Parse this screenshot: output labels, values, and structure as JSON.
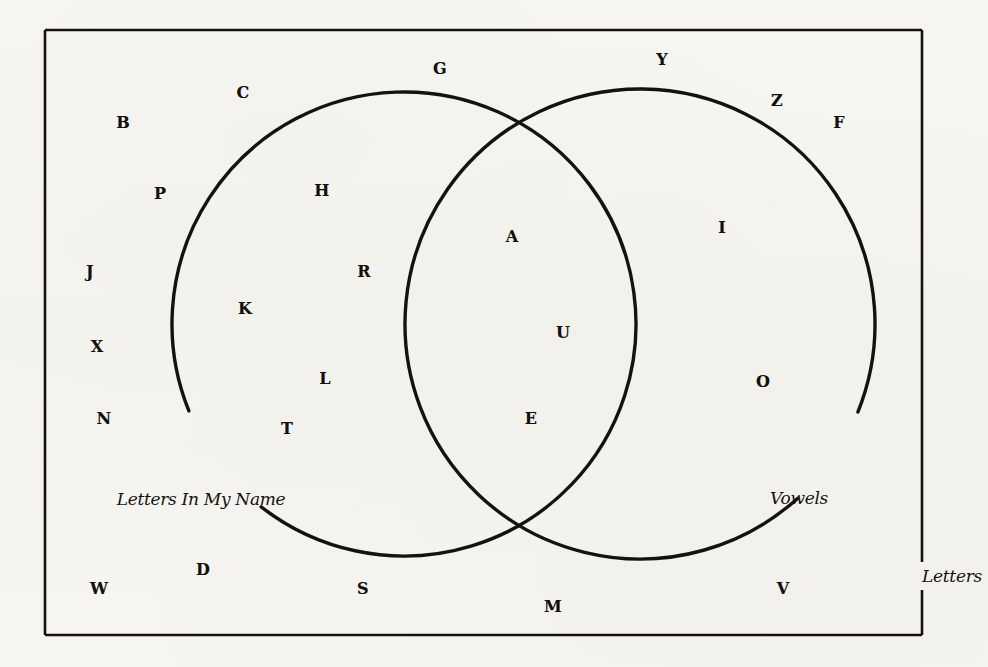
{
  "diagram": {
    "type": "venn",
    "title": "",
    "universe": {
      "label": "Letters",
      "label_x": 952,
      "label_y": 576,
      "rect": {
        "x": 45,
        "y": 30,
        "width": 877,
        "height": 605
      }
    },
    "sets": [
      {
        "id": "letters-in-my-name",
        "label": "Letters In My Name",
        "label_x": 201,
        "label_y": 499,
        "center_x": 404,
        "center_y": 324,
        "radius": 232
      },
      {
        "id": "vowels",
        "label": "Vowels",
        "label_x": 799,
        "label_y": 498,
        "center_x": 640,
        "center_y": 324,
        "radius": 235
      }
    ],
    "colors": {
      "stroke": "#141210",
      "background": "#f7f5f1",
      "text": "#13110f"
    },
    "regions": {
      "only_left": [
        "H",
        "R",
        "K",
        "L",
        "T"
      ],
      "intersection": [
        "A",
        "U",
        "E"
      ],
      "only_right": [
        "I",
        "O"
      ],
      "outside_both": [
        "B",
        "C",
        "G",
        "Y",
        "Z",
        "F",
        "P",
        "J",
        "X",
        "N",
        "W",
        "D",
        "S",
        "M",
        "V"
      ]
    },
    "elements": [
      {
        "label": "B",
        "x": 123,
        "y": 123,
        "region": "outside_both"
      },
      {
        "label": "C",
        "x": 243,
        "y": 93,
        "region": "outside_both"
      },
      {
        "label": "G",
        "x": 440,
        "y": 69,
        "region": "outside_both"
      },
      {
        "label": "Y",
        "x": 662,
        "y": 60,
        "region": "outside_both"
      },
      {
        "label": "Z",
        "x": 777,
        "y": 101,
        "region": "outside_both"
      },
      {
        "label": "F",
        "x": 839,
        "y": 123,
        "region": "outside_both"
      },
      {
        "label": "P",
        "x": 160,
        "y": 194,
        "region": "outside_both"
      },
      {
        "label": "J",
        "x": 90,
        "y": 272,
        "region": "outside_both"
      },
      {
        "label": "X",
        "x": 97,
        "y": 347,
        "region": "outside_both"
      },
      {
        "label": "N",
        "x": 104,
        "y": 419,
        "region": "outside_both"
      },
      {
        "label": "W",
        "x": 99,
        "y": 589,
        "region": "outside_both"
      },
      {
        "label": "D",
        "x": 203,
        "y": 570,
        "region": "outside_both"
      },
      {
        "label": "S",
        "x": 363,
        "y": 589,
        "region": "outside_both"
      },
      {
        "label": "M",
        "x": 553,
        "y": 607,
        "region": "outside_both"
      },
      {
        "label": "V",
        "x": 783,
        "y": 589,
        "region": "outside_both"
      },
      {
        "label": "H",
        "x": 322,
        "y": 191,
        "region": "only_left"
      },
      {
        "label": "R",
        "x": 364,
        "y": 272,
        "region": "only_left"
      },
      {
        "label": "K",
        "x": 245,
        "y": 309,
        "region": "only_left"
      },
      {
        "label": "L",
        "x": 325,
        "y": 379,
        "region": "only_left"
      },
      {
        "label": "T",
        "x": 287,
        "y": 429,
        "region": "only_left"
      },
      {
        "label": "A",
        "x": 512,
        "y": 237,
        "region": "intersection"
      },
      {
        "label": "U",
        "x": 563,
        "y": 333,
        "region": "intersection"
      },
      {
        "label": "E",
        "x": 531,
        "y": 419,
        "region": "intersection"
      },
      {
        "label": "I",
        "x": 722,
        "y": 228,
        "region": "only_right"
      },
      {
        "label": "O",
        "x": 763,
        "y": 382,
        "region": "only_right"
      }
    ]
  }
}
